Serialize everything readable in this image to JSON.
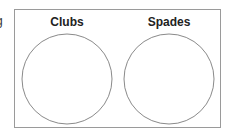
{
  "cropped_left_text": "g",
  "venn": {
    "sets": [
      {
        "label": "Clubs",
        "cx": 67,
        "cy": 79,
        "r": 45
      },
      {
        "label": "Spades",
        "cx": 169,
        "cy": 79,
        "r": 45
      }
    ],
    "stroke_color": "#8a8a8a",
    "border_color": "#9a9a9a"
  }
}
